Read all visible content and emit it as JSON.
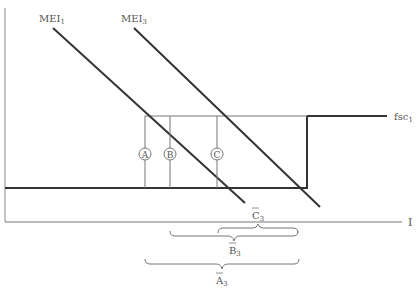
{
  "diagram": {
    "labels": {
      "mei1": "MEI",
      "mei1_sub": "1",
      "mei3": "MEI",
      "mei3_sub": "3",
      "fsc": "fsc",
      "fsc_sub": "1",
      "x_axis": "I",
      "point_a": "A",
      "point_b": "B",
      "point_c": "C",
      "brace_c": "C",
      "brace_c_sub": "3",
      "brace_b": "B",
      "brace_b_sub": "3",
      "brace_a": "A",
      "brace_a_sub": "3"
    },
    "colors": {
      "line": "#333333",
      "thin_line": "#666666",
      "label": "#555555"
    }
  }
}
